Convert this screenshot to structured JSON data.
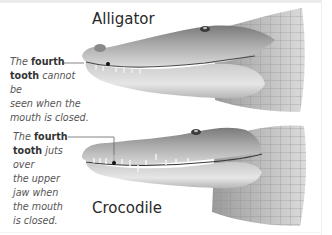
{
  "figure": {
    "colors": {
      "background": "#ffffff",
      "title_text": "#2a2a2a",
      "note_text": "#555555",
      "leader_line": "#555555",
      "skin_dark": "#6e6e6e",
      "skin_light": "#d8d8d8"
    }
  },
  "alligator": {
    "title": "Alligator",
    "note": {
      "prefix": "The",
      "bold": "fourth tooth",
      "rest": "cannot be seen when the mouth is closed.",
      "line1_a": "The",
      "line1_b": "fourth",
      "line2_a": "tooth",
      "line2_b": "cannot be",
      "line3": "seen when the",
      "line4": "mouth is closed."
    },
    "pointer": {
      "from": [
        62,
        63
      ],
      "to": [
        108,
        64
      ]
    }
  },
  "crocodile": {
    "title": "Crocodile",
    "note": {
      "prefix": "The",
      "bold": "fourth tooth",
      "rest": "juts over the upper jaw when the mouth is closed.",
      "line1_a": "The",
      "line1_b": "fourth",
      "line2_a": "tooth",
      "line2_b": "juts over",
      "line3": "the upper",
      "line4": "jaw when",
      "line5": "the mouth",
      "line6": "is closed."
    },
    "pointer": {
      "from": [
        68,
        137
      ],
      "corner": [
        114,
        137
      ],
      "to": [
        114,
        163
      ]
    }
  }
}
